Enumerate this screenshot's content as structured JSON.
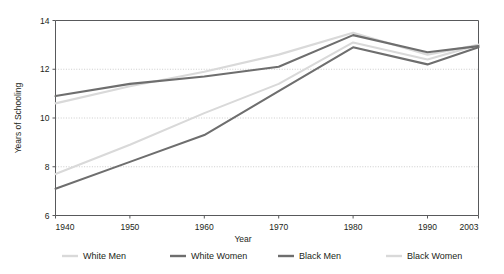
{
  "chart_data": {
    "type": "line",
    "title": "",
    "xlabel": "Year",
    "ylabel": "Years of Schooling",
    "xlim": [
      1940,
      2003
    ],
    "ylim": [
      6,
      14
    ],
    "grid": true,
    "grid_values": [
      8,
      10,
      12
    ],
    "legend_position": "bottom",
    "x": [
      1940,
      1950,
      1960,
      1970,
      1980,
      1990,
      2003
    ],
    "xticklabels": [
      "1940",
      "1950",
      "1960",
      "1970",
      "1980",
      "1990",
      "2003"
    ],
    "yticks": [
      6,
      8,
      10,
      12,
      14
    ],
    "yticklabels": [
      "6",
      "8",
      "10",
      "12",
      "14"
    ],
    "series": [
      {
        "name": "White Men",
        "color": "#d9d9d9",
        "values": [
          10.6,
          11.3,
          11.9,
          12.6,
          13.5,
          12.6,
          13.0
        ]
      },
      {
        "name": "White Women",
        "color": "#6e6e6e",
        "values": [
          10.9,
          11.4,
          11.7,
          12.1,
          13.4,
          12.7,
          12.95
        ]
      },
      {
        "name": "Black Men",
        "color": "#6e6e6e",
        "values": [
          7.1,
          8.2,
          9.3,
          11.1,
          12.9,
          12.2,
          12.9
        ]
      },
      {
        "name": "Black Women",
        "color": "#d9d9d9",
        "values": [
          7.7,
          8.9,
          10.2,
          11.4,
          13.1,
          12.4,
          13.0
        ]
      }
    ]
  },
  "legend": {
    "items": [
      {
        "label": "White Men",
        "swatch": "#d9d9d9"
      },
      {
        "label": "White Women",
        "swatch": "#6e6e6e"
      },
      {
        "label": "Black Men",
        "swatch": "#6e6e6e"
      },
      {
        "label": "Black Women",
        "swatch": "#d9d9d9"
      }
    ]
  },
  "axes": {
    "x_title": "Year",
    "y_title": "Years of Schooling"
  },
  "colors": {
    "axis": "#58595b",
    "grid": "#bfbfbf",
    "light_series": "#d9d9d9",
    "dark_series": "#6e6e6e",
    "text": "#231f20",
    "background": "#ffffff"
  }
}
